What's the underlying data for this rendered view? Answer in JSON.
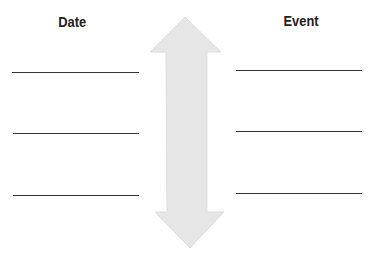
{
  "headings": {
    "left": "Date",
    "right": "Event"
  },
  "arrow": {
    "fill": "#e8e8e8",
    "direction": "bidirectional-vertical"
  },
  "left_lines": [
    {
      "value": ""
    },
    {
      "value": ""
    },
    {
      "value": ""
    }
  ],
  "right_lines": [
    {
      "value": ""
    },
    {
      "value": ""
    },
    {
      "value": ""
    }
  ]
}
